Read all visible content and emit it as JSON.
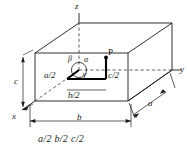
{
  "figure": {
    "kind": "crystal-unit-cell-diagram",
    "axes": {
      "z": "z",
      "y": "y",
      "x": "x"
    },
    "edge_dimensions": {
      "c": "c",
      "b": "b",
      "a": "a"
    },
    "angles": {
      "alpha": "α",
      "beta": "β",
      "gamma": "γ"
    },
    "point": {
      "label": "P"
    },
    "fractional_coordinates": {
      "a_half": "a/2",
      "b_half": "b/2",
      "c_half": "c/2"
    },
    "caption": "a/2 b/2 c/2",
    "colors": {
      "line": "#1a1a1a",
      "dashed": "#3b3b3b",
      "background": "#ffffff",
      "emphasis": "#000000"
    }
  }
}
